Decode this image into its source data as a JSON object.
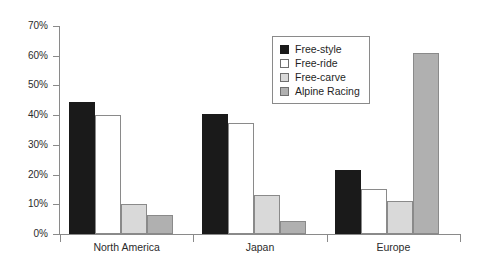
{
  "chart_data": {
    "type": "bar",
    "title": "",
    "xlabel": "",
    "ylabel": "",
    "categories": [
      "North America",
      "Japan",
      "Europe"
    ],
    "series": [
      {
        "name": "Free-style",
        "color": "#1a1a1a",
        "values": [
          44.5,
          40.3,
          21.5
        ]
      },
      {
        "name": "Free-ride",
        "color": "#ffffff",
        "values": [
          40.0,
          37.3,
          15.0
        ]
      },
      {
        "name": "Free-carve",
        "color": "#d9d9d9",
        "values": [
          10.0,
          13.0,
          11.0
        ]
      },
      {
        "name": "Alpine Racing",
        "color": "#b0b0b0",
        "values": [
          6.5,
          4.5,
          61.0
        ]
      }
    ],
    "ylim": [
      0,
      70
    ],
    "yticks": [
      0,
      10,
      20,
      30,
      40,
      50,
      60,
      70
    ],
    "ytick_labels": [
      "0%",
      "10%",
      "20%",
      "30%",
      "40%",
      "50%",
      "60%",
      "70%"
    ],
    "grid": false,
    "legend_position": "top-right",
    "axis_color": "#8a8a8a"
  }
}
